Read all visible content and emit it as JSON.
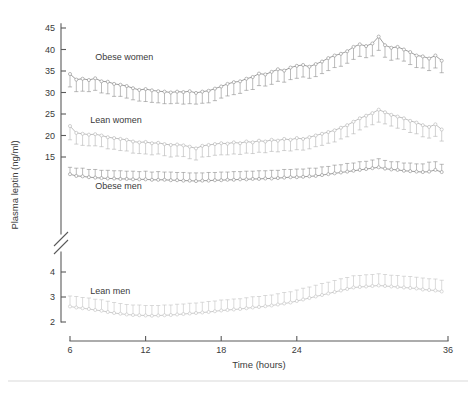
{
  "figure": {
    "width": 476,
    "height": 394,
    "background": "#ffffff"
  },
  "axes": {
    "y_title": "Plasma leptin (ng/ml)",
    "x_title": "Time (hours)",
    "axis_color": "#5a5a5a",
    "text_color": "#3a3a3a",
    "break_marker": "double-slash",
    "x_ticks": [
      6,
      12,
      18,
      24,
      36
    ],
    "x_tick_labels": [
      "6",
      "12",
      "18",
      "24",
      "36"
    ],
    "y_upper_ticks": [
      15,
      20,
      25,
      30,
      35,
      40,
      45
    ],
    "y_upper_tick_labels": [
      "15",
      "20",
      "25",
      "30",
      "35",
      "40",
      "45"
    ],
    "y_lower_ticks": [
      2,
      3,
      4
    ],
    "y_lower_tick_labels": [
      "2",
      "3",
      "4"
    ]
  },
  "chart_data": {
    "type": "line",
    "title": "",
    "xlabel": "Time (hours)",
    "ylabel": "Plasma leptin (ng/ml)",
    "xlim": [
      5,
      36
    ],
    "ylim_upper": [
      14,
      46
    ],
    "ylim_lower": [
      1.8,
      4.4
    ],
    "axis_break": true,
    "grid": false,
    "legend": "inline-labels",
    "marker": "open-circle",
    "errorbars": "SEM",
    "x": [
      6,
      6.5,
      7,
      7.5,
      8,
      8.5,
      9,
      9.5,
      10,
      10.5,
      11,
      11.5,
      12,
      12.5,
      13,
      13.5,
      14,
      14.5,
      15,
      15.5,
      16,
      16.5,
      17,
      17.5,
      18,
      18.5,
      19,
      19.5,
      20,
      20.5,
      21,
      21.5,
      22,
      22.5,
      23,
      23.5,
      24,
      24.5,
      25,
      25.5,
      26,
      26.5,
      27,
      27.5,
      28,
      28.5,
      29,
      29.5,
      30,
      30.5,
      31,
      31.5,
      32,
      32.5,
      33,
      33.5,
      34,
      34.5,
      35,
      35.5
    ],
    "series": [
      {
        "name": "Obese women",
        "color": "#8d8d8d",
        "errorbar_direction": "down",
        "label_x": 8.0,
        "label_y": 37.6,
        "values": [
          34.3,
          33.0,
          33.2,
          32.9,
          33.3,
          32.6,
          32.5,
          32.0,
          31.8,
          31.5,
          31.0,
          30.6,
          30.8,
          30.5,
          30.3,
          30.2,
          30.0,
          30.2,
          30.1,
          30.3,
          29.9,
          30.2,
          30.4,
          30.9,
          31.4,
          32.0,
          32.4,
          32.6,
          33.2,
          33.6,
          34.4,
          34.2,
          34.8,
          35.4,
          35.1,
          35.8,
          36.2,
          36.4,
          36.0,
          36.6,
          37.2,
          38.0,
          38.6,
          39.0,
          39.6,
          40.6,
          41.2,
          40.8,
          41.4,
          43.0,
          41.0,
          40.4,
          40.6,
          40.0,
          39.4,
          38.6,
          38.4,
          37.9,
          38.6,
          37.4
        ],
        "errors": [
          3.0,
          2.8,
          2.9,
          2.7,
          2.8,
          2.7,
          2.8,
          2.9,
          2.7,
          2.8,
          2.7,
          2.6,
          2.9,
          2.8,
          2.7,
          2.8,
          2.6,
          2.7,
          2.8,
          2.9,
          2.6,
          2.7,
          2.8,
          2.8,
          2.7,
          2.8,
          2.9,
          2.8,
          2.7,
          2.9,
          2.8,
          2.7,
          2.9,
          2.8,
          2.7,
          2.8,
          2.9,
          2.8,
          2.7,
          2.9,
          2.8,
          2.9,
          2.8,
          2.9,
          2.8,
          2.9,
          2.8,
          2.7,
          2.9,
          3.2,
          2.8,
          2.9,
          2.8,
          2.7,
          2.9,
          2.8,
          2.7,
          2.8,
          2.9,
          2.8
        ]
      },
      {
        "name": "Lean women",
        "color": "#b4b4b4",
        "errorbar_direction": "down",
        "label_x": 7.6,
        "label_y": 22.9,
        "values": [
          22.2,
          20.6,
          20.4,
          20.2,
          20.3,
          20.0,
          19.6,
          19.4,
          19.2,
          19.0,
          18.6,
          18.4,
          18.5,
          18.2,
          18.3,
          18.0,
          17.8,
          17.9,
          17.7,
          17.4,
          17.0,
          17.6,
          17.8,
          18.0,
          18.2,
          18.1,
          18.4,
          18.2,
          18.6,
          18.4,
          18.8,
          18.6,
          19.0,
          18.8,
          19.2,
          19.0,
          19.4,
          19.2,
          19.6,
          20.0,
          20.4,
          20.8,
          21.2,
          21.8,
          22.4,
          23.2,
          24.0,
          24.6,
          25.2,
          26.0,
          25.4,
          24.8,
          24.4,
          24.0,
          23.4,
          23.0,
          22.4,
          22.0,
          22.6,
          21.4
        ],
        "errors": [
          3.2,
          2.6,
          2.7,
          2.6,
          2.7,
          2.6,
          2.7,
          2.6,
          2.7,
          2.6,
          2.7,
          2.6,
          2.8,
          2.7,
          2.6,
          2.7,
          2.8,
          2.7,
          2.6,
          2.8,
          2.7,
          2.6,
          2.7,
          2.6,
          2.7,
          2.6,
          2.7,
          2.6,
          2.7,
          2.6,
          2.7,
          2.6,
          2.7,
          2.6,
          2.7,
          2.6,
          2.7,
          2.6,
          2.7,
          2.6,
          2.7,
          2.6,
          2.7,
          2.6,
          2.7,
          2.8,
          2.7,
          2.6,
          2.7,
          2.9,
          2.7,
          2.6,
          2.7,
          2.6,
          2.7,
          2.6,
          2.7,
          2.6,
          2.8,
          2.7
        ]
      },
      {
        "name": "Obese men",
        "color": "#8d8d8d",
        "errorbar_direction": "up",
        "label_x": 8.0,
        "label_y": 7.6,
        "values": [
          11.0,
          10.6,
          10.5,
          10.3,
          10.2,
          10.1,
          10.0,
          10.0,
          9.9,
          9.9,
          9.8,
          9.8,
          9.8,
          9.7,
          9.7,
          9.7,
          9.6,
          9.6,
          9.5,
          9.5,
          9.4,
          9.5,
          9.5,
          9.6,
          9.6,
          9.7,
          9.7,
          9.8,
          9.8,
          9.9,
          9.9,
          10.0,
          10.0,
          10.1,
          10.2,
          10.3,
          10.3,
          10.4,
          10.5,
          10.6,
          10.8,
          11.0,
          11.2,
          11.4,
          11.6,
          11.8,
          12.0,
          12.2,
          12.4,
          12.6,
          12.3,
          12.1,
          12.0,
          11.8,
          11.7,
          11.6,
          11.5,
          11.6,
          12.0,
          11.5
        ],
        "errors": [
          1.6,
          1.8,
          1.9,
          1.8,
          1.9,
          1.8,
          1.9,
          1.8,
          1.9,
          1.8,
          1.9,
          1.8,
          1.9,
          1.8,
          1.9,
          1.8,
          1.9,
          1.8,
          1.9,
          1.8,
          1.9,
          1.8,
          1.9,
          1.8,
          1.9,
          1.8,
          1.9,
          1.8,
          1.9,
          1.8,
          1.9,
          1.8,
          1.9,
          1.8,
          1.9,
          1.8,
          1.9,
          1.8,
          1.9,
          1.8,
          1.9,
          1.8,
          1.9,
          1.8,
          1.9,
          1.8,
          1.9,
          1.8,
          1.9,
          2.0,
          1.9,
          1.8,
          1.9,
          1.8,
          1.9,
          1.8,
          1.9,
          2.2,
          1.9,
          1.8
        ]
      },
      {
        "name": "Lean men",
        "color": "#c3c3c3",
        "errorbar_direction": "up",
        "label_x": 7.6,
        "label_y": 3.12,
        "values": [
          2.62,
          2.58,
          2.55,
          2.52,
          2.48,
          2.45,
          2.4,
          2.36,
          2.33,
          2.3,
          2.28,
          2.27,
          2.26,
          2.25,
          2.26,
          2.27,
          2.28,
          2.3,
          2.32,
          2.34,
          2.36,
          2.38,
          2.4,
          2.43,
          2.46,
          2.48,
          2.5,
          2.52,
          2.55,
          2.58,
          2.6,
          2.63,
          2.66,
          2.7,
          2.74,
          2.78,
          2.84,
          2.9,
          2.96,
          3.02,
          3.08,
          3.14,
          3.2,
          3.26,
          3.32,
          3.38,
          3.4,
          3.42,
          3.44,
          3.46,
          3.44,
          3.42,
          3.4,
          3.38,
          3.36,
          3.34,
          3.3,
          3.28,
          3.26,
          3.22
        ],
        "errors": [
          0.42,
          0.44,
          0.43,
          0.44,
          0.43,
          0.44,
          0.43,
          0.42,
          0.41,
          0.4,
          0.4,
          0.41,
          0.4,
          0.41,
          0.4,
          0.41,
          0.4,
          0.41,
          0.4,
          0.41,
          0.4,
          0.41,
          0.42,
          0.41,
          0.42,
          0.41,
          0.42,
          0.41,
          0.42,
          0.43,
          0.42,
          0.43,
          0.42,
          0.43,
          0.44,
          0.43,
          0.44,
          0.45,
          0.44,
          0.45,
          0.46,
          0.45,
          0.46,
          0.47,
          0.46,
          0.47,
          0.46,
          0.47,
          0.46,
          0.47,
          0.46,
          0.45,
          0.46,
          0.45,
          0.46,
          0.45,
          0.46,
          0.45,
          0.46,
          0.45
        ]
      }
    ]
  }
}
